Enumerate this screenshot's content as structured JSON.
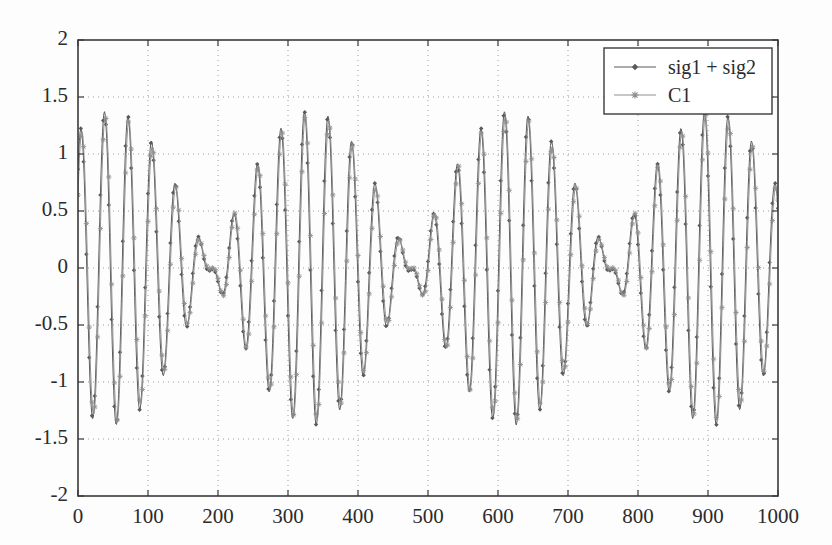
{
  "chart_data": {
    "type": "line",
    "title": "",
    "xlabel": "",
    "ylabel": "",
    "xlim": [
      0,
      1000
    ],
    "ylim": [
      -2,
      2
    ],
    "grid": true,
    "grid_style": "dotted",
    "legend_position": "top-right",
    "xticks": [
      0,
      100,
      200,
      300,
      400,
      500,
      600,
      700,
      800,
      900,
      1000
    ],
    "yticks": [
      -2,
      -1.5,
      -1,
      -0.5,
      0,
      0.5,
      1,
      1.5,
      2
    ],
    "xtick_labels": [
      "0",
      "100",
      "200",
      "300",
      "400",
      "500",
      "600",
      "700",
      "800",
      "900",
      "1000"
    ],
    "ytick_labels": [
      "-2",
      "-1.5",
      "-1",
      "-0.5",
      "0",
      "0.5",
      "1",
      "1.5",
      "2"
    ],
    "series": [
      {
        "name": "sig1 + sig2",
        "color": "#5a5a5a",
        "marker": "diamond",
        "linewidth": 1.0,
        "description": "Sum of two sinusoids producing a beat/chirp envelope; amplitude modulated with a node near x=500 and maxima near x=60 and x=965",
        "model": {
          "kind": "two-tone-beat",
          "components": [
            {
              "amplitude": 0.72,
              "frequency_cycles_per_1000": 28.0,
              "phase_deg": 75
            },
            {
              "amplitude": 0.66,
              "frequency_cycles_per_1000": 31.5,
              "phase_deg": 15
            }
          ],
          "envelope_peak": 1.38,
          "envelope_node_x": 500
        },
        "sample_points": [
          {
            "x": 0,
            "y": 1.18
          },
          {
            "x": 10,
            "y": 0.25
          },
          {
            "x": 20,
            "y": -1.0
          },
          {
            "x": 45,
            "y": 1.33
          },
          {
            "x": 62,
            "y": -1.38
          },
          {
            "x": 80,
            "y": 1.27
          },
          {
            "x": 100,
            "y": -1.16
          },
          {
            "x": 128,
            "y": 1.2
          },
          {
            "x": 150,
            "y": -1.1
          },
          {
            "x": 172,
            "y": 1.13
          },
          {
            "x": 196,
            "y": -1.22
          },
          {
            "x": 220,
            "y": 1.2
          },
          {
            "x": 245,
            "y": -1.05
          },
          {
            "x": 272,
            "y": 0.99
          },
          {
            "x": 300,
            "y": -1.03
          },
          {
            "x": 324,
            "y": 0.84
          },
          {
            "x": 352,
            "y": -1.0
          },
          {
            "x": 384,
            "y": 1.17
          },
          {
            "x": 410,
            "y": -1.21
          },
          {
            "x": 436,
            "y": 1.21
          },
          {
            "x": 462,
            "y": -1.2
          },
          {
            "x": 484,
            "y": 0.42
          },
          {
            "x": 500,
            "y": 0.05
          },
          {
            "x": 516,
            "y": 0.53
          },
          {
            "x": 540,
            "y": -1.18
          },
          {
            "x": 562,
            "y": 0.95
          },
          {
            "x": 588,
            "y": -1.12
          },
          {
            "x": 614,
            "y": 0.83
          },
          {
            "x": 640,
            "y": -0.95
          },
          {
            "x": 664,
            "y": 0.96
          },
          {
            "x": 690,
            "y": -1.04
          },
          {
            "x": 716,
            "y": 0.95
          },
          {
            "x": 742,
            "y": -1.02
          },
          {
            "x": 766,
            "y": 1.05
          },
          {
            "x": 790,
            "y": -1.2
          },
          {
            "x": 818,
            "y": 1.09
          },
          {
            "x": 844,
            "y": -1.18
          },
          {
            "x": 868,
            "y": 1.1
          },
          {
            "x": 894,
            "y": -1.18
          },
          {
            "x": 920,
            "y": 1.1
          },
          {
            "x": 946,
            "y": -1.2
          },
          {
            "x": 965,
            "y": 1.33
          },
          {
            "x": 975,
            "y": -1.52
          },
          {
            "x": 990,
            "y": 0.1
          },
          {
            "x": 1000,
            "y": 1.18
          }
        ]
      },
      {
        "name": "C1",
        "color": "#8f8f8f",
        "marker": "star",
        "linewidth": 1.0,
        "description": "First intrinsic mode / component closely overlapping the sum signal with a small phase offset",
        "model": {
          "kind": "two-tone-beat",
          "components": [
            {
              "amplitude": 0.7,
              "frequency_cycles_per_1000": 28.0,
              "phase_deg": 62
            },
            {
              "amplitude": 0.64,
              "frequency_cycles_per_1000": 31.5,
              "phase_deg": 2
            }
          ],
          "envelope_peak": 1.34,
          "envelope_node_x": 500
        },
        "sample_points": [
          {
            "x": 0,
            "y": 0.92
          },
          {
            "x": 10,
            "y": 0.15
          },
          {
            "x": 20,
            "y": -0.98
          },
          {
            "x": 45,
            "y": 1.3
          },
          {
            "x": 62,
            "y": -1.36
          },
          {
            "x": 80,
            "y": 1.22
          },
          {
            "x": 100,
            "y": -1.13
          },
          {
            "x": 128,
            "y": 1.16
          },
          {
            "x": 150,
            "y": -1.06
          },
          {
            "x": 172,
            "y": 1.08
          },
          {
            "x": 196,
            "y": -1.2
          },
          {
            "x": 220,
            "y": 1.17
          },
          {
            "x": 245,
            "y": -1.02
          },
          {
            "x": 272,
            "y": 0.95
          },
          {
            "x": 300,
            "y": -1.0
          },
          {
            "x": 324,
            "y": 0.8
          },
          {
            "x": 352,
            "y": -0.97
          },
          {
            "x": 384,
            "y": 1.13
          },
          {
            "x": 410,
            "y": -1.18
          },
          {
            "x": 436,
            "y": 1.18
          },
          {
            "x": 462,
            "y": -1.17
          },
          {
            "x": 484,
            "y": 0.38
          },
          {
            "x": 500,
            "y": 0.02
          },
          {
            "x": 516,
            "y": 0.5
          },
          {
            "x": 540,
            "y": -1.15
          },
          {
            "x": 562,
            "y": 0.92
          },
          {
            "x": 588,
            "y": -1.09
          },
          {
            "x": 614,
            "y": 0.8
          },
          {
            "x": 640,
            "y": -0.92
          },
          {
            "x": 664,
            "y": 0.93
          },
          {
            "x": 690,
            "y": -1.01
          },
          {
            "x": 716,
            "y": 0.92
          },
          {
            "x": 742,
            "y": -0.99
          },
          {
            "x": 766,
            "y": 1.02
          },
          {
            "x": 790,
            "y": -1.17
          },
          {
            "x": 818,
            "y": 1.06
          },
          {
            "x": 844,
            "y": -1.15
          },
          {
            "x": 868,
            "y": 1.07
          },
          {
            "x": 894,
            "y": -1.15
          },
          {
            "x": 920,
            "y": 1.07
          },
          {
            "x": 946,
            "y": -1.17
          },
          {
            "x": 965,
            "y": 1.3
          },
          {
            "x": 975,
            "y": -1.49
          },
          {
            "x": 990,
            "y": 0.07
          },
          {
            "x": 1000,
            "y": 1.15
          }
        ]
      }
    ]
  },
  "legend": {
    "entries": [
      {
        "label": "sig1 + sig2",
        "color": "#5a5a5a",
        "marker": "diamond"
      },
      {
        "label": "C1",
        "color": "#8f8f8f",
        "marker": "star"
      }
    ]
  },
  "style": {
    "background": "#fdfdfd",
    "axis_color": "#3a3a3a",
    "grid_color": "#9a9a9a",
    "text_color": "#2b2b2b"
  },
  "geometry": {
    "plot_left": 78,
    "plot_right": 778,
    "plot_top": 40,
    "plot_bottom": 496
  }
}
